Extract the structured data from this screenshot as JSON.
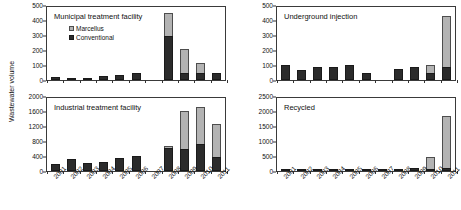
{
  "figure": {
    "ylabel": "Wastewater volume",
    "legend": [
      {
        "key": "marcellus",
        "label": "Marcellus",
        "color": "#b3b3b3"
      },
      {
        "key": "conventional",
        "label": "Conventional",
        "color": "#2b2b2b"
      }
    ]
  },
  "chart_data": [
    {
      "type": "bar",
      "title": "Municipal treatment facility",
      "panel": "top-left",
      "stacked": true,
      "xlabel": "",
      "ylabel": "Wastewater volume",
      "ylim": [
        0,
        500
      ],
      "yticks": [
        0,
        100,
        200,
        300,
        400,
        500
      ],
      "grid": false,
      "legend_position": "top-left-inside",
      "categories": [
        "2001",
        "2002",
        "2003",
        "2004",
        "2005",
        "2006",
        "2007",
        "2008",
        "2009",
        "2010",
        "2011"
      ],
      "series": [
        {
          "name": "Conventional",
          "values": [
            20,
            12,
            13,
            30,
            35,
            50,
            0,
            295,
            50,
            50,
            50
          ]
        },
        {
          "name": "Marcellus",
          "values": [
            0,
            0,
            0,
            0,
            0,
            0,
            0,
            150,
            155,
            65,
            0
          ]
        }
      ]
    },
    {
      "type": "bar",
      "title": "Underground injection",
      "panel": "top-right",
      "stacked": true,
      "xlabel": "",
      "ylabel": "Wastewater volume",
      "ylim": [
        0,
        500
      ],
      "yticks": [
        0,
        100,
        200,
        300,
        400,
        500
      ],
      "grid": false,
      "categories": [
        "2001",
        "2002",
        "2003",
        "2004",
        "2005",
        "2006",
        "2007",
        "2008",
        "2009",
        "2010",
        "2011"
      ],
      "series": [
        {
          "name": "Conventional",
          "values": [
            100,
            70,
            90,
            90,
            100,
            50,
            0,
            75,
            90,
            50,
            85
          ]
        },
        {
          "name": "Marcellus",
          "values": [
            0,
            0,
            0,
            0,
            0,
            0,
            0,
            0,
            0,
            50,
            345
          ]
        }
      ]
    },
    {
      "type": "bar",
      "title": "Industrial treatment facility",
      "panel": "bottom-left",
      "stacked": true,
      "xlabel": "",
      "ylabel": "Wastewater volume",
      "ylim": [
        0,
        2000
      ],
      "yticks": [
        0,
        400,
        800,
        1200,
        1600,
        2000
      ],
      "grid": false,
      "categories": [
        "2001",
        "2002",
        "2003",
        "2004",
        "2005",
        "2006",
        "2007",
        "2008",
        "2009",
        "2010",
        "2011"
      ],
      "series": [
        {
          "name": "Conventional",
          "values": [
            200,
            310,
            215,
            230,
            355,
            400,
            0,
            620,
            600,
            710,
            370
          ]
        },
        {
          "name": "Marcellus",
          "values": [
            0,
            0,
            0,
            0,
            0,
            0,
            0,
            60,
            1010,
            1010,
            880
          ]
        }
      ]
    },
    {
      "type": "bar",
      "title": "Recycled",
      "panel": "bottom-right",
      "stacked": true,
      "xlabel": "",
      "ylabel": "Wastewater volume",
      "ylim": [
        0,
        2500
      ],
      "yticks": [
        0,
        500,
        1000,
        1500,
        2000,
        2500
      ],
      "grid": false,
      "categories": [
        "2001",
        "2002",
        "2003",
        "2004",
        "2005",
        "2006",
        "2007",
        "2008",
        "2009",
        "2010",
        "2011"
      ],
      "series": [
        {
          "name": "Conventional",
          "values": [
            5,
            8,
            30,
            5,
            28,
            6,
            5,
            80,
            90,
            55,
            110
          ]
        },
        {
          "name": "Marcellus",
          "values": [
            0,
            0,
            0,
            0,
            0,
            0,
            0,
            0,
            0,
            415,
            1710
          ]
        }
      ]
    }
  ]
}
